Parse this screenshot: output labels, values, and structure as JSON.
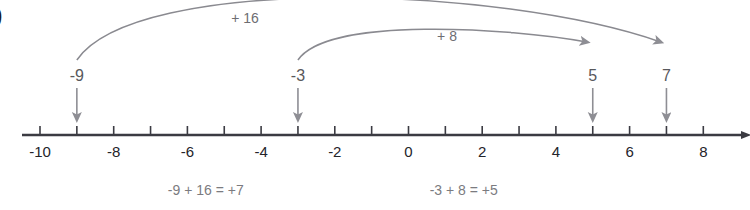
{
  "figure": {
    "list_marker": ")",
    "type": "number-line-diagram",
    "colors": {
      "axis": "#3b3b42",
      "arc": "#8a8a90",
      "marker_arrow": "#8e8e94",
      "tick_label": "#24242a",
      "equation_text": "#7b7b80",
      "jump_label": "#6d6d72"
    }
  },
  "number_line": {
    "min": -10,
    "max": 8,
    "tick_step": 1,
    "label_step": 2,
    "tick_labels": [
      "-10",
      "-8",
      "-6",
      "-4",
      "-2",
      "0",
      "2",
      "4",
      "6",
      "8"
    ],
    "tick_label_values": [
      -10,
      -8,
      -6,
      -4,
      -2,
      0,
      2,
      4,
      6,
      8
    ],
    "tick_values": [
      -10,
      -9,
      -8,
      -7,
      -6,
      -5,
      -4,
      -3,
      -2,
      -1,
      0,
      1,
      2,
      3,
      4,
      5,
      6,
      7,
      8
    ],
    "has_end_arrow": true
  },
  "jumps": [
    {
      "label": "+ 16",
      "from": -9,
      "to": 7,
      "from_label": "-9",
      "to_label": "7",
      "amount": 16
    },
    {
      "label": "+ 8",
      "from": -3,
      "to": 5,
      "from_label": "-3",
      "to_label": "5",
      "amount": 8
    }
  ],
  "markers": [
    {
      "label": "-9",
      "value": -9
    },
    {
      "label": "-3",
      "value": -3
    },
    {
      "label": "5",
      "value": 5
    },
    {
      "label": "7",
      "value": 7
    }
  ],
  "equations": [
    {
      "text": "-9 + 16 = +7",
      "center_value": -5.5
    },
    {
      "text": "-3 + 8 = +5",
      "center_value": 1.5
    }
  ]
}
